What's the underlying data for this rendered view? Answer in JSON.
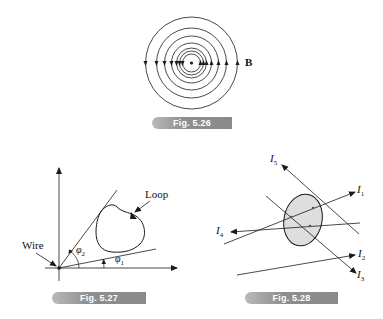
{
  "figures": [
    {
      "id": "fig-5-26",
      "caption": "Fig. 5.26",
      "field_label": "B",
      "circle_radii": [
        9,
        12,
        15,
        20,
        27,
        35,
        46
      ]
    },
    {
      "id": "fig-5-27",
      "caption": "Fig. 5.27",
      "labels": {
        "wire": "Wire",
        "loop": "Loop",
        "phi1": "φ",
        "phi1_sub": "1",
        "phi2": "φ",
        "phi2_sub": "2"
      }
    },
    {
      "id": "fig-5-28",
      "caption": "Fig. 5.28",
      "currents": [
        {
          "name": "I",
          "sub": "1"
        },
        {
          "name": "I",
          "sub": "2"
        },
        {
          "name": "I",
          "sub": "3"
        },
        {
          "name": "I",
          "sub": "4"
        },
        {
          "name": "I",
          "sub": "5"
        }
      ]
    }
  ],
  "colors": {
    "line": "#1a1a1a",
    "loop_fill": "#dedede",
    "caption_bg": "#8e8e8e"
  }
}
